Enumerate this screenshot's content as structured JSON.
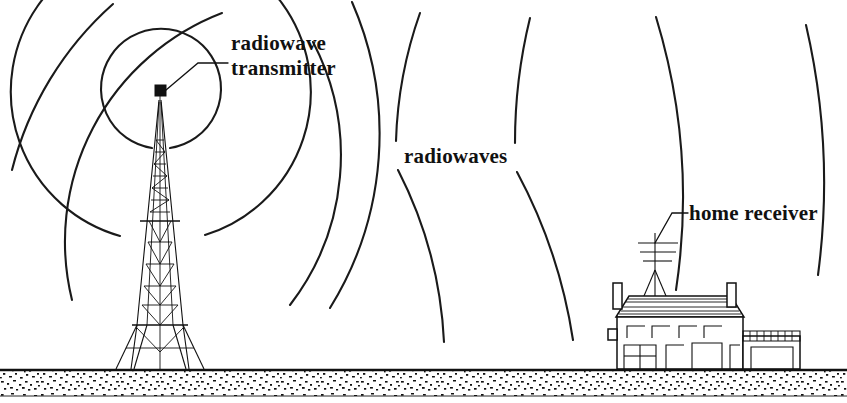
{
  "diagram": {
    "background_color": "#ffffff",
    "ink_color": "#111111"
  },
  "labels": {
    "transmitter_line1": "radiowave",
    "transmitter_line2": "transmitter",
    "radiowaves": "radiowaves",
    "home_receiver": "home receiver"
  },
  "elements": {
    "transmitter_tower_name": "radio transmitter lattice tower",
    "transmitter_box_name": "transmitter emitter box",
    "house_name": "home with receiving antenna",
    "antenna_name": "rooftop television antenna",
    "garage_name": "attached garage",
    "ground_name": "stippled ground band"
  },
  "wave_arcs": {
    "count": 6,
    "center_x": 160,
    "center_y": 90,
    "radii": [
      60,
      150,
      245,
      330,
      420,
      520
    ],
    "description": "concentric arcs radiating from the transmitter at the tower top"
  },
  "ground": {
    "top_y": 369,
    "bottom_y": 396,
    "texture": "stipple"
  }
}
